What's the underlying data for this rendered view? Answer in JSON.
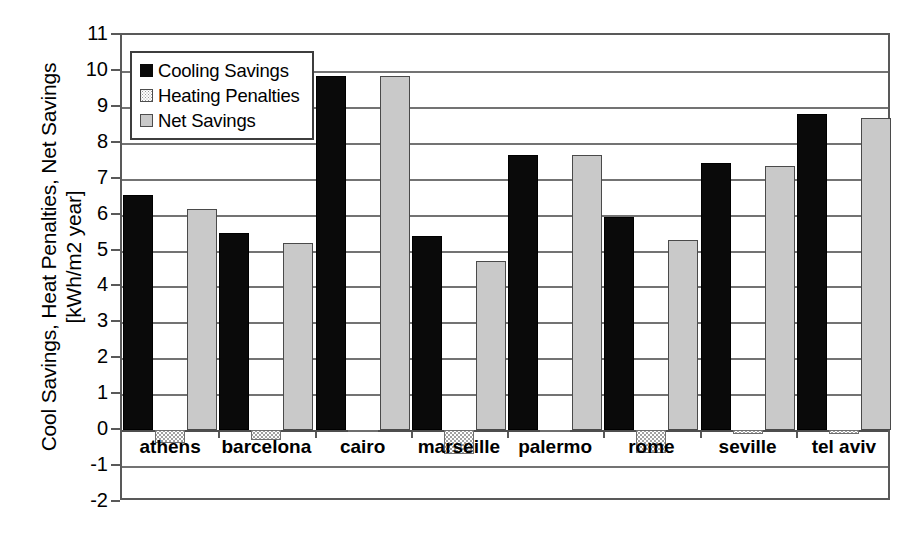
{
  "chart_data": {
    "type": "bar",
    "title": "",
    "xlabel": "",
    "ylabel": "Cool Savings, Heat Penalties, Net Savings [kWh/m2 year]",
    "ylabel_lines": [
      "Cool Savings, Heat Penalties, Net Savings",
      "[kWh/m2 year]"
    ],
    "ylim": [
      -2,
      11
    ],
    "ytick_labels": [
      "11",
      "10",
      "9",
      "8",
      "7",
      "6",
      "5",
      "4",
      "3",
      "2",
      "1",
      "0",
      "-1",
      "-2"
    ],
    "yticks": [
      11,
      10,
      9,
      8,
      7,
      6,
      5,
      4,
      3,
      2,
      1,
      0,
      -1,
      -2
    ],
    "grid": true,
    "legend_position": "upper-left-inside",
    "categories": [
      "athens",
      "barcelona",
      "cairo",
      "marseille",
      "palermo",
      "rome",
      "seville",
      "tel aviv"
    ],
    "series": [
      {
        "name": "Cooling Savings",
        "color": "#0a0a0a",
        "values": [
          6.55,
          5.5,
          9.85,
          5.4,
          7.65,
          5.93,
          7.45,
          8.8
        ]
      },
      {
        "name": "Heating Penalties",
        "color": "#ffffff",
        "values": [
          -0.37,
          -0.28,
          -0.05,
          -0.67,
          -0.02,
          -0.63,
          -0.1,
          -0.1
        ]
      },
      {
        "name": "Net Savings",
        "color": "#c9c9c9",
        "values": [
          6.15,
          5.22,
          9.85,
          4.72,
          7.65,
          5.3,
          7.35,
          8.7
        ]
      }
    ]
  }
}
